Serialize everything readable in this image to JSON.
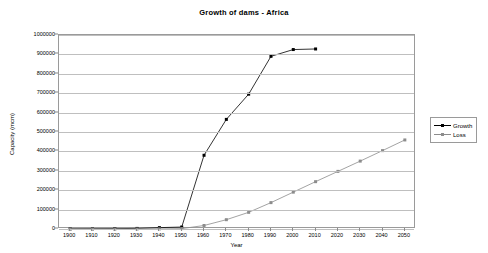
{
  "chart_data": {
    "type": "line",
    "title": "Growth of dams - Africa",
    "xlabel": "Year",
    "ylabel": "Capacity (mcm)",
    "xlim": [
      1895,
      2055
    ],
    "ylim": [
      0,
      1000000
    ],
    "grid": true,
    "legend_position": "right",
    "x": [
      1900,
      1910,
      1920,
      1930,
      1940,
      1950,
      1960,
      1970,
      1980,
      1990,
      2000,
      2010,
      2020,
      2030,
      2040,
      2050
    ],
    "xticks": [
      "1900",
      "1910",
      "1920",
      "1930",
      "1940",
      "1950",
      "1960",
      "1970",
      "1980",
      "1990",
      "2000",
      "2010",
      "2020",
      "2030",
      "2040",
      "2050"
    ],
    "yticks": [
      "0",
      "100000",
      "200000",
      "300000",
      "400000",
      "500000",
      "600000",
      "700000",
      "800000",
      "900000",
      "1000000"
    ],
    "series": [
      {
        "name": "Growth",
        "color": "#000000",
        "marker": "square",
        "x": [
          1900,
          1910,
          1920,
          1930,
          1940,
          1950,
          1960,
          1970,
          1980,
          1990,
          2000,
          2010
        ],
        "values": [
          1000,
          1500,
          2000,
          3000,
          7000,
          10000,
          380000,
          565000,
          695000,
          890000,
          925000,
          928000
        ]
      },
      {
        "name": "Loss",
        "color": "#8c8c8c",
        "marker": "square",
        "x": [
          1900,
          1910,
          1920,
          1930,
          1940,
          1950,
          1960,
          1970,
          1980,
          1990,
          2000,
          2010,
          2020,
          2030,
          2040,
          2050
        ],
        "values": [
          0,
          0,
          0,
          0,
          500,
          2000,
          18000,
          48000,
          86000,
          136000,
          190000,
          244000,
          297000,
          350000,
          404000,
          459000
        ]
      }
    ]
  },
  "legend": {
    "entries": [
      {
        "label": "Growth"
      },
      {
        "label": "Loss"
      }
    ]
  }
}
